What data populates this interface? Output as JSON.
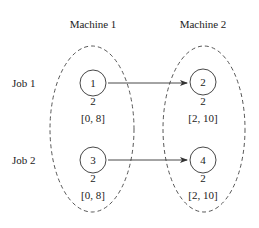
{
  "machines": [
    {
      "label": "Machine 1"
    },
    {
      "label": "Machine 2"
    }
  ],
  "jobs": [
    {
      "label": "Job 1"
    },
    {
      "label": "Job 2"
    }
  ],
  "operations": [
    {
      "id": "1",
      "duration": "2",
      "window": "[0, 8]",
      "machine": "Machine 1",
      "job": "Job 1"
    },
    {
      "id": "2",
      "duration": "2",
      "window": "[2, 10]",
      "machine": "Machine 2",
      "job": "Job 1"
    },
    {
      "id": "3",
      "duration": "2",
      "window": "[0, 8]",
      "machine": "Machine 1",
      "job": "Job 2"
    },
    {
      "id": "4",
      "duration": "2",
      "window": "[2, 10]",
      "machine": "Machine 2",
      "job": "Job 2"
    }
  ],
  "edges": [
    {
      "from": "1",
      "to": "2"
    },
    {
      "from": "3",
      "to": "4"
    }
  ],
  "colors": {
    "stroke": "#333333",
    "text": "#222222",
    "background": "#ffffff"
  }
}
